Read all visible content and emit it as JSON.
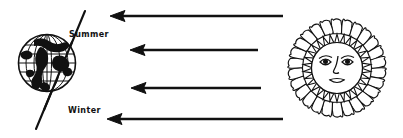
{
  "diagram": {
    "background_color": "#ffffff",
    "ink_color": "#111111",
    "labels": {
      "summer": "Summer",
      "winter": "Winter"
    },
    "earth": {
      "name": "earth-globe",
      "center_x": 47,
      "center_y": 63,
      "radius": 28.5,
      "axis_tilt_label": "tilted rotational axis",
      "axis_start_x": 85,
      "axis_start_y": 11,
      "axis_end_x": 36,
      "axis_end_y": 129,
      "meridian_count": 7,
      "parallel_count": 5
    },
    "sun": {
      "name": "sun-with-face",
      "center_x": 337,
      "center_y": 68,
      "outer_ray_radius": 48,
      "outer_ray_count": 26,
      "inner_ray_radius": 30,
      "inner_ray_count": 30,
      "face_radius": 26,
      "face_features": [
        "left-eye",
        "right-eye",
        "nose",
        "mouth"
      ]
    },
    "rays": [
      {
        "name": "sunlight-ray-1",
        "y": 16,
        "head_x": 110,
        "tail_x": 283
      },
      {
        "name": "sunlight-ray-2",
        "y": 50,
        "head_x": 130,
        "tail_x": 258
      },
      {
        "name": "sunlight-ray-3",
        "y": 88,
        "head_x": 131,
        "tail_x": 261
      },
      {
        "name": "sunlight-ray-4",
        "y": 119,
        "head_x": 107,
        "tail_x": 283
      }
    ]
  }
}
